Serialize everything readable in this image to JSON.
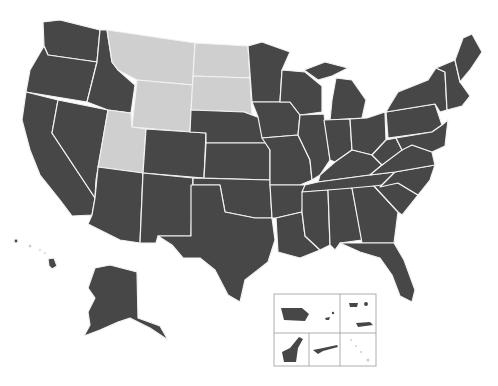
{
  "map": {
    "title": "United States map with territories",
    "colors": {
      "default": "#474747",
      "highlight": "#cfcfcf",
      "border": "#f2f2f2",
      "background": "#ffffff"
    },
    "highlighted_states": [
      "Montana",
      "North Dakota",
      "South Dakota",
      "Wyoming",
      "Utah"
    ],
    "states": [
      {
        "id": "WA",
        "name": "Washington",
        "highlighted": false
      },
      {
        "id": "OR",
        "name": "Oregon",
        "highlighted": false
      },
      {
        "id": "CA",
        "name": "California",
        "highlighted": false
      },
      {
        "id": "ID",
        "name": "Idaho",
        "highlighted": false
      },
      {
        "id": "NV",
        "name": "Nevada",
        "highlighted": false
      },
      {
        "id": "MT",
        "name": "Montana",
        "highlighted": true
      },
      {
        "id": "WY",
        "name": "Wyoming",
        "highlighted": true
      },
      {
        "id": "UT",
        "name": "Utah",
        "highlighted": true
      },
      {
        "id": "ND",
        "name": "North Dakota",
        "highlighted": true
      },
      {
        "id": "SD",
        "name": "South Dakota",
        "highlighted": true
      },
      {
        "id": "AZ",
        "name": "Arizona",
        "highlighted": false
      },
      {
        "id": "CO",
        "name": "Colorado",
        "highlighted": false
      },
      {
        "id": "NM",
        "name": "New Mexico",
        "highlighted": false
      },
      {
        "id": "NE",
        "name": "Nebraska",
        "highlighted": false
      },
      {
        "id": "KS",
        "name": "Kansas",
        "highlighted": false
      },
      {
        "id": "OK",
        "name": "Oklahoma",
        "highlighted": false
      },
      {
        "id": "TX",
        "name": "Texas",
        "highlighted": false
      },
      {
        "id": "MN",
        "name": "Minnesota",
        "highlighted": false
      },
      {
        "id": "IA",
        "name": "Iowa",
        "highlighted": false
      },
      {
        "id": "MO",
        "name": "Missouri",
        "highlighted": false
      },
      {
        "id": "AR",
        "name": "Arkansas",
        "highlighted": false
      },
      {
        "id": "LA",
        "name": "Louisiana",
        "highlighted": false
      },
      {
        "id": "WI",
        "name": "Wisconsin",
        "highlighted": false
      },
      {
        "id": "IL",
        "name": "Illinois",
        "highlighted": false
      },
      {
        "id": "MI",
        "name": "Michigan",
        "highlighted": false
      },
      {
        "id": "IN",
        "name": "Indiana",
        "highlighted": false
      },
      {
        "id": "OH",
        "name": "Ohio",
        "highlighted": false
      },
      {
        "id": "KY",
        "name": "Kentucky",
        "highlighted": false
      },
      {
        "id": "TN",
        "name": "Tennessee",
        "highlighted": false
      },
      {
        "id": "MS",
        "name": "Mississippi",
        "highlighted": false
      },
      {
        "id": "AL",
        "name": "Alabama",
        "highlighted": false
      },
      {
        "id": "GA",
        "name": "Georgia",
        "highlighted": false
      },
      {
        "id": "FL",
        "name": "Florida",
        "highlighted": false
      },
      {
        "id": "SC",
        "name": "South Carolina",
        "highlighted": false
      },
      {
        "id": "NC",
        "name": "North Carolina",
        "highlighted": false
      },
      {
        "id": "VA",
        "name": "Virginia",
        "highlighted": false
      },
      {
        "id": "WV",
        "name": "West Virginia",
        "highlighted": false
      },
      {
        "id": "PA",
        "name": "Pennsylvania",
        "highlighted": false
      },
      {
        "id": "NY",
        "name": "New York",
        "highlighted": false
      },
      {
        "id": "NE_states",
        "name": "New England",
        "highlighted": false
      },
      {
        "id": "ME",
        "name": "Maine",
        "highlighted": false
      },
      {
        "id": "AK",
        "name": "Alaska",
        "highlighted": false
      },
      {
        "id": "HI",
        "name": "Hawaii",
        "highlighted": false
      }
    ],
    "territories_inset": [
      {
        "id": "PR",
        "name": "Puerto Rico"
      },
      {
        "id": "VI",
        "name": "U.S. Virgin Islands"
      },
      {
        "id": "GU",
        "name": "Guam"
      },
      {
        "id": "MP",
        "name": "Northern Mariana Islands"
      },
      {
        "id": "AS",
        "name": "American Samoa"
      }
    ]
  }
}
